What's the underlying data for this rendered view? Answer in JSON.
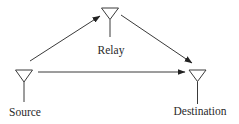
{
  "diagram": {
    "type": "relay-network",
    "colors": {
      "stroke": "#3a3a3a",
      "text": "#2a2a2a",
      "background": "#ffffff"
    },
    "nodes": [
      {
        "id": "source",
        "label": "Source",
        "icon": "antenna-icon"
      },
      {
        "id": "relay",
        "label": "Relay",
        "icon": "antenna-icon"
      },
      {
        "id": "destination",
        "label": "Destination",
        "icon": "antenna-icon"
      }
    ],
    "edges": [
      {
        "from": "source",
        "to": "relay",
        "directed": true
      },
      {
        "from": "relay",
        "to": "destination",
        "directed": true
      },
      {
        "from": "source",
        "to": "destination",
        "directed": true
      }
    ]
  }
}
